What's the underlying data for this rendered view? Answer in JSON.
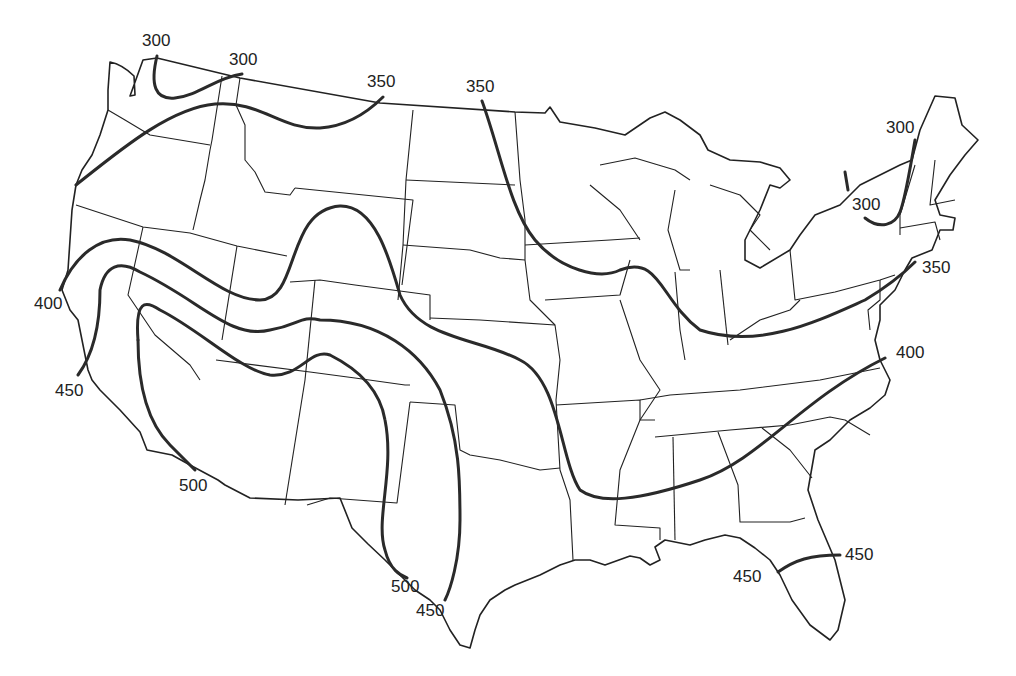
{
  "map": {
    "type": "isoline map",
    "region": "Contiguous United States",
    "line_color": "#2a2a2a",
    "background": "#ffffff"
  },
  "contour_labels": [
    {
      "id": "l1",
      "value": "300",
      "x": 142,
      "y": 46
    },
    {
      "id": "l2",
      "value": "300",
      "x": 229,
      "y": 65
    },
    {
      "id": "l3",
      "value": "350",
      "x": 367,
      "y": 87
    },
    {
      "id": "l4",
      "value": "350",
      "x": 466,
      "y": 92
    },
    {
      "id": "l5",
      "value": "300",
      "x": 886,
      "y": 133
    },
    {
      "id": "l6",
      "value": "300",
      "x": 852,
      "y": 210
    },
    {
      "id": "l7",
      "value": "350",
      "x": 922,
      "y": 273
    },
    {
      "id": "l8",
      "value": "400",
      "x": 34,
      "y": 309
    },
    {
      "id": "l9",
      "value": "400",
      "x": 896,
      "y": 358
    },
    {
      "id": "l10",
      "value": "450",
      "x": 55,
      "y": 396
    },
    {
      "id": "l11",
      "value": "500",
      "x": 179,
      "y": 491
    },
    {
      "id": "l12",
      "value": "450",
      "x": 845,
      "y": 560
    },
    {
      "id": "l13",
      "value": "450",
      "x": 733,
      "y": 582
    },
    {
      "id": "l14",
      "value": "500",
      "x": 391,
      "y": 592
    },
    {
      "id": "l15",
      "value": "450",
      "x": 416,
      "y": 616
    }
  ],
  "contour_levels": [
    300,
    350,
    400,
    450,
    500
  ]
}
